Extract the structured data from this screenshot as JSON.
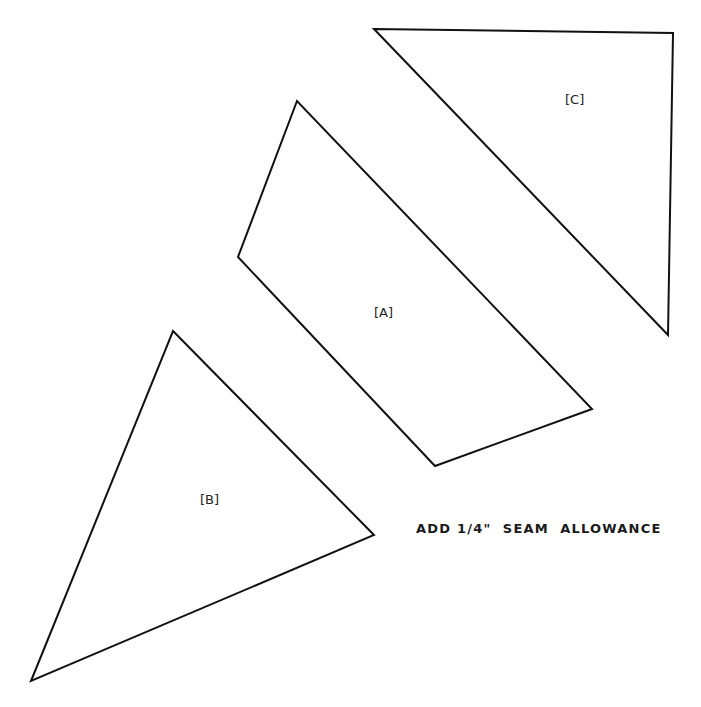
{
  "pieces": [
    {
      "id": "A",
      "label": "[A]"
    },
    {
      "id": "B",
      "label": "[B]"
    },
    {
      "id": "C",
      "label": "[C]"
    }
  ],
  "note": "ADD 1/4\"  SEAM  ALLOWANCE",
  "colors": {
    "stroke": "#111111",
    "background": "#ffffff"
  }
}
